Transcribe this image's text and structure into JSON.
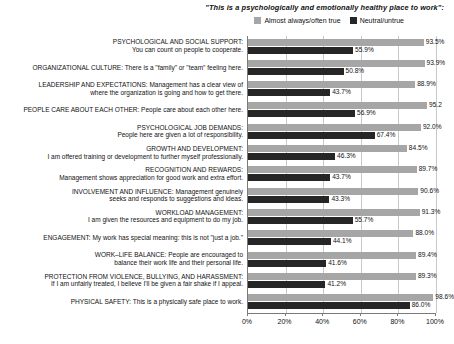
{
  "header": {
    "title": "\"This is a psychologically and emotionally healthy place to work\":"
  },
  "legend": {
    "position": "top",
    "entries": [
      {
        "label": "Almost always/often true",
        "color": "#a6a6a6",
        "icon": "legend-swatch-positive"
      },
      {
        "label": "Neutral/untrue",
        "color": "#262626",
        "icon": "legend-swatch-negative"
      }
    ]
  },
  "axis": {
    "xlabel": "",
    "ylabel": "",
    "ticks": [
      "0%",
      "20%",
      "40%",
      "60%",
      "80%",
      "100%"
    ],
    "tick_values": [
      0,
      20,
      40,
      60,
      80,
      100
    ]
  },
  "chart_data": {
    "type": "bar",
    "orientation": "horizontal",
    "title": "\"This is a psychologically and emotionally healthy place to work\":",
    "xlabel": "",
    "ylabel": "",
    "xlim": [
      0,
      100
    ],
    "grid": true,
    "legend_position": "top",
    "categories": [
      "PSYCHOLOGICAL AND SOCIAL SUPPORT: You can count on people to cooperate.",
      "ORGANIZATIONAL CULTURE: There is a \"family\" or \"team\" feeling here.",
      "LEADERSHIP AND EXPECTATIONS: Management has a clear view of where the organization is going and how to get there.",
      "PEOPLE CARE ABOUT EACH OTHER: People care about each other here.",
      "PSYCHOLOGICAL JOB DEMANDS: People here are given a lot of responsibility.",
      "GROWTH AND DEVELOPMENT: I am offered training or development to further myself professionally.",
      "RECOGNITION AND REWARDS: Management shows appreciation for good work and extra effort.",
      "INVOLVEMENT AND INFLUENCE: Management genuinely seeks and responds to suggestions and ideas.",
      "WORKLOAD MANAGEMENT: I am given the resources and equipment to do my job.",
      "ENGAGEMENT: My work has special meaning: this is not \"just a job.\"",
      "WORK–LIFE BALANCE: People are encouraged to balance their work life and their personal life.",
      "PROTECTION FROM VIOLENCE, BULLYING, AND HARASSMENT: If I am unfairly treated, I believe I'll be given a fair shake if I appeal.",
      "PHYSICAL SAFETY: This is a physically safe place to work."
    ],
    "category_lines": [
      [
        "PSYCHOLOGICAL AND SOCIAL SUPPORT:",
        "You can count on people to cooperate."
      ],
      [
        "ORGANIZATIONAL CULTURE: There is a \"family\" or \"team\" feeling here."
      ],
      [
        "LEADERSHIP AND EXPECTATIONS: Management has a clear view of",
        "where the organization is going and how to get there."
      ],
      [
        "PEOPLE CARE ABOUT EACH OTHER: People care about each other here."
      ],
      [
        "PSYCHOLOGICAL JOB DEMANDS:",
        "People here are given a lot of responsibility."
      ],
      [
        "GROWTH AND DEVELOPMENT:",
        "I am offered training or development to further myself professionally."
      ],
      [
        "RECOGNITION AND REWARDS:",
        "Management shows appreciation for good work and extra effort."
      ],
      [
        "INVOLVEMENT AND INFLUENCE: Management genuinely",
        "seeks and responds to suggestions and ideas."
      ],
      [
        "WORKLOAD MANAGEMENT:",
        "I am given the resources and equipment to do my job."
      ],
      [
        "ENGAGEMENT: My work has special meaning: this is not \"just a job.\""
      ],
      [
        "WORK–LIFE BALANCE: People are encouraged to",
        "balance their work life and their personal life."
      ],
      [
        "PROTECTION FROM VIOLENCE, BULLYING, AND HARASSMENT:",
        "If I am unfairly treated, I believe I'll be given a fair shake if I appeal."
      ],
      [
        "PHYSICAL SAFETY: This is a physically safe place to work."
      ]
    ],
    "series": [
      {
        "name": "Almost always/often true",
        "color": "#a6a6a6",
        "values": [
          93.5,
          93.9,
          88.9,
          95.2,
          92.0,
          84.5,
          89.7,
          90.6,
          91.3,
          88.0,
          89.4,
          89.3,
          98.6
        ],
        "labels": [
          "93.5%",
          "93.9%",
          "88.9%",
          "95.2",
          "92.0%",
          "84.5%",
          "89.7%",
          "90.6%",
          "91.3%",
          "88.0%",
          "89.4%",
          "89.3%",
          "98.6%"
        ]
      },
      {
        "name": "Neutral/untrue",
        "color": "#262626",
        "values": [
          55.9,
          50.8,
          43.7,
          56.9,
          67.4,
          46.3,
          43.7,
          43.3,
          55.7,
          44.1,
          41.6,
          41.2,
          86.0
        ],
        "labels": [
          "55.9%",
          "50.8%",
          "43.7%",
          "56.9%",
          "67.4%",
          "46.3%",
          "43.7%",
          "43.3%",
          "55.7%",
          "44.1%",
          "41.6%",
          "41.2%",
          "86.0%"
        ]
      }
    ]
  }
}
